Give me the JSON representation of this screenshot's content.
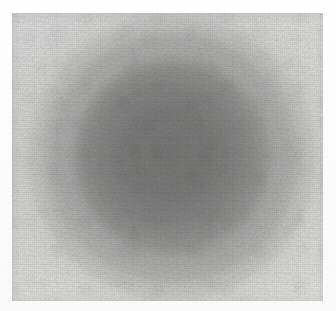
{
  "image": {
    "kind": "photographic-plate-scan",
    "subject": "diffuse dark circular halo on grey photographic plate",
    "width_px": 336,
    "height_px": 311,
    "has_text": false,
    "has_axes": false,
    "has_legend": false,
    "alt_text": "Grainy grey photographic plate showing a large soft-edged dark circular blob near the centre"
  },
  "canvas": {
    "background_color": "#fdfdfd",
    "margin_color": "#ffffff"
  },
  "plate": {
    "name": "photographic-plate",
    "left_px": 12,
    "top_px": 13,
    "width_px": 311,
    "height_px": 288,
    "base_color": "#e7e7e6",
    "corner_color": "#ededec",
    "edge_shade_color": "#d9d9d8"
  },
  "feature": {
    "name": "dark-halo-disc",
    "center_x_px": 172,
    "center_y_px": 158,
    "outer_radius_px": 143,
    "core_radius_px": 98,
    "core_color": "#707070",
    "mid_color": "#9a9a9a",
    "edge_color": "#cfcfcf",
    "background_color": "#e6e6e5"
  },
  "texture": {
    "name": "film-grain",
    "fine_opacity": 0.4,
    "coarse_opacity": 0.3,
    "mottle_opacity": 0.22,
    "scanline_opacity": 0.16
  }
}
